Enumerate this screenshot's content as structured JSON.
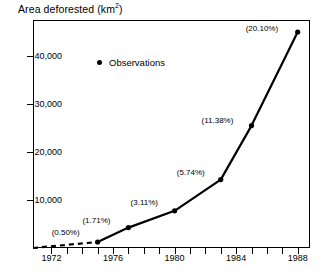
{
  "chart_data": {
    "type": "line",
    "title": "Area deforested (km2)",
    "title_main": "Area deforested (km",
    "title_sup": "2",
    "title_close": ")",
    "xlabel": "",
    "ylabel": "Area deforested (km2)",
    "xlim": [
      1970.8,
      1988.8
    ],
    "ylim": [
      0,
      47500
    ],
    "grid": false,
    "legend_position": "upper-left-inside",
    "legend": [
      {
        "name": "Observations",
        "marker": "dot"
      }
    ],
    "ytick_labels": [
      "10,000",
      "20,000",
      "30,000",
      "40,000"
    ],
    "ytick_values": [
      10000,
      20000,
      30000,
      40000
    ],
    "xtick_labels": [
      "1972",
      "1976",
      "1980",
      "1984",
      "1988"
    ],
    "xtick_values": [
      1972,
      1976,
      1980,
      1984,
      1988
    ],
    "xtick_minor_values": [
      1973,
      1974,
      1975,
      1977,
      1978,
      1979,
      1981,
      1982,
      1983,
      1985,
      1986,
      1987
    ],
    "series": [
      {
        "name": "Observations",
        "style": "solid",
        "x": [
          1975,
          1977,
          1980,
          1983,
          1985,
          1988
        ],
        "y": [
          1250,
          4250,
          7750,
          14250,
          25500,
          45000
        ],
        "labels": [
          "(0.50%)",
          "(1.71%)",
          "(3.11%)",
          "(5.74%)",
          "(11.38%)",
          "(20.10%)"
        ]
      },
      {
        "name": "Extrapolated",
        "style": "dashed",
        "x": [
          1970.8,
          1975
        ],
        "y": [
          0,
          1250
        ],
        "labels": []
      }
    ],
    "annotations": [
      {
        "text": "(0.50%)",
        "value": 0.5,
        "year": 1975
      },
      {
        "text": "(1.71%)",
        "value": 1.71,
        "year": 1977
      },
      {
        "text": "(3.11%)",
        "value": 3.11,
        "year": 1980
      },
      {
        "text": "(5.74%)",
        "value": 5.74,
        "year": 1983
      },
      {
        "text": "(11.38%)",
        "value": 11.38,
        "year": 1985
      },
      {
        "text": "(20.10%)",
        "value": 20.1,
        "year": 1988
      }
    ]
  },
  "colors": {
    "line": "#000000",
    "marker": "#000000",
    "axis": "#000000",
    "background": "#ffffff"
  }
}
